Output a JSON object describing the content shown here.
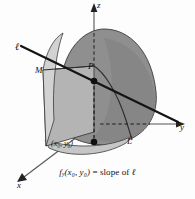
{
  "figure": {
    "type": "3d-surface-diagram",
    "background_color": "#fdfdfd",
    "axes": {
      "z": {
        "label": "z",
        "direction": "up"
      },
      "y": {
        "label": "y",
        "direction": "right"
      },
      "x": {
        "label": "x",
        "direction": "down-left"
      }
    },
    "labels": {
      "tangent_line": "ℓ",
      "point_M": "M",
      "point_P": "P",
      "curve_L": "L",
      "base_point": "(x₀, y₀)"
    },
    "caption": {
      "function": "f",
      "subscript": "y",
      "arguments": "(x₀, y₀)",
      "relation": "= slope of",
      "line_name": "ℓ",
      "full_text": "fᵧ(x₀, y₀) = slope of ℓ"
    },
    "colors": {
      "surface_dark": "#8a8a8a",
      "surface_mid": "#9a9a9a",
      "plane_light": "#b2b2b2",
      "base_light": "#c9c9c9",
      "outline": "#2a2a2a",
      "axis": "#444444",
      "text": "#111111"
    }
  }
}
